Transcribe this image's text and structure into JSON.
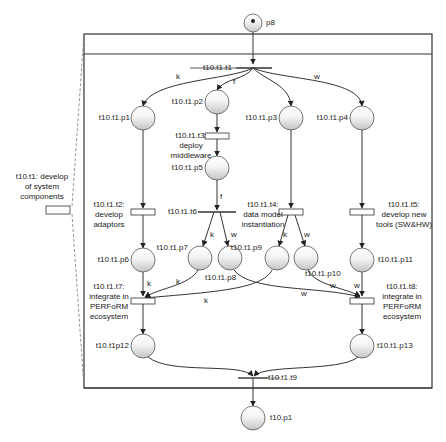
{
  "diagram": {
    "type": "petri-net",
    "colors": {
      "stroke": "#333333",
      "place_fill_top": "#ffffff",
      "place_fill_bottom": "#c8c8c8",
      "token": "#222222",
      "box_border": "#333333",
      "dashed": "#777777"
    },
    "outer_place": {
      "id": "p8",
      "label": "p8",
      "has_token": true
    },
    "final_place": {
      "id": "t10.p1",
      "label": "t10.p1"
    },
    "subnet": {
      "id": "t10.t1",
      "label_line1": "t10.t1: develop",
      "label_line2": "of system",
      "label_line3": "components"
    },
    "places": {
      "p1": "t10.t1.p1",
      "p2": "t10.t1.p2",
      "p3": "t10.t1.p3",
      "p4": "t10.t1.p4",
      "p5": "t10.t1.p5",
      "p6": "t10.t1.p6",
      "p7": "t10.t1.p7",
      "p8": "t10.t1.p8",
      "p9": "t10.t1.p9",
      "p10": "t10.t1.p10",
      "p11": "t10.t1.p11",
      "p12": "t10.t1p12",
      "p13": "t10.t1.p13"
    },
    "transitions": {
      "t1": {
        "label": "t10.t1.t1"
      },
      "t2": {
        "l1": "t10.t1.t2:",
        "l2": "develop",
        "l3": "adaptors"
      },
      "t3": {
        "l1": "t10.t1.t3:",
        "l2": "deploy",
        "l3": "middleware"
      },
      "t4": {
        "l1": "t10.t1.t4:",
        "l2": "data model",
        "l3": "instantiation"
      },
      "t5": {
        "l1": "t10.t1.t5:",
        "l2": "develop new",
        "l3": "tools (SW&HW)"
      },
      "t6": {
        "label": "t10.t1.t6"
      },
      "t7": {
        "l1": "t10.t1.t7:",
        "l2": "integrate in",
        "l3": "PERFoRM",
        "l4": "ecosystem"
      },
      "t8": {
        "l1": "t10.t1.t8:",
        "l2": "integrate in",
        "l3": "PERFoRM",
        "l4": "ecosystem"
      },
      "t9": {
        "label": "t10.t1.t9"
      }
    },
    "arc_labels": {
      "t1_p1": "k",
      "t1_p2": "f",
      "t1_p4": "w",
      "p5_t6": "f",
      "t6_p7": "k",
      "t6_p8": "w",
      "t4_p9": "k",
      "t4_p10": "w",
      "p6_t7": "k",
      "p7_t7": "k",
      "p9_t7": "k",
      "p8_t8": "w",
      "p10_t8": "w",
      "p11_t8": "w"
    }
  }
}
